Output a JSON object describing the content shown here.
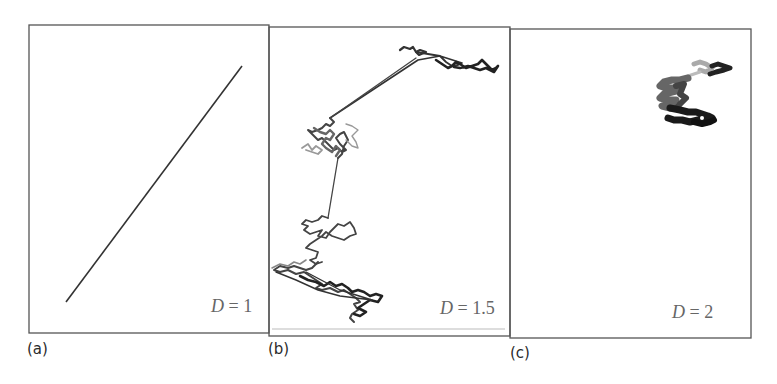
{
  "figure": {
    "panels": [
      {
        "id": "a",
        "label": "(a)",
        "dimension_var": "D",
        "dimension_eq": " = 1",
        "description": "straight line"
      },
      {
        "id": "b",
        "label": "(b)",
        "dimension_var": "D",
        "dimension_eq": " = 1.5",
        "description": "Lévy-flight-like random walk with long jumps"
      },
      {
        "id": "c",
        "label": "(c)",
        "dimension_var": "D",
        "dimension_eq": " = 2",
        "description": "compact Brownian random walk cluster"
      }
    ],
    "colors": {
      "frame": "#555555",
      "trace_dark": "#222222",
      "trace_mid": "#555555",
      "trace_light": "#9a9a9a",
      "label_text": "#666666"
    }
  }
}
